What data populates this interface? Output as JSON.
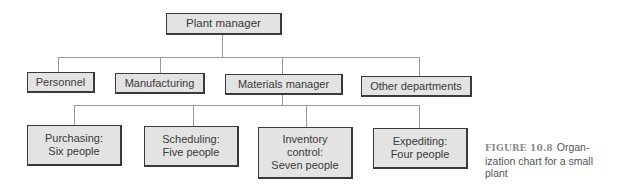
{
  "diagram": {
    "type": "organization-chart",
    "colors": {
      "box_fill": "#e3e3e3",
      "box_border": "#3a3a3a",
      "connector": "#9a9a9a",
      "text": "#3a3a3a"
    },
    "root": {
      "label": "Plant manager"
    },
    "level1": [
      {
        "label": "Personnel"
      },
      {
        "label": "Manufacturing"
      },
      {
        "label": "Materials manager"
      },
      {
        "label": "Other departments"
      }
    ],
    "level2_parent": "Materials manager",
    "level2": [
      {
        "label": "Purchasing:\nSix people"
      },
      {
        "label": "Scheduling:\nFive people"
      },
      {
        "label": "Inventory\ncontrol:\nSeven people"
      },
      {
        "label": "Expediting:\nFour people"
      }
    ]
  },
  "caption": {
    "figure_label": "FIGURE 10.8",
    "text": "Organ-­ization chart for a small plant"
  }
}
